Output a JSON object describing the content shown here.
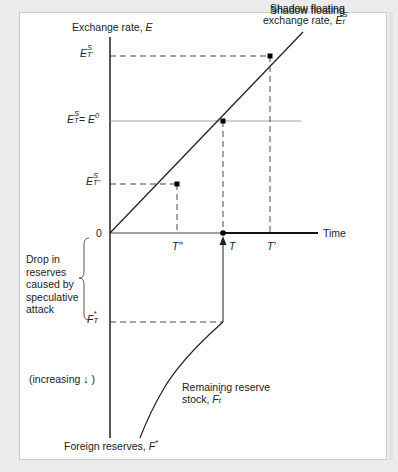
{
  "figure": {
    "y_axis_label": "Exchange rate, ",
    "y_axis_var": "E",
    "x_axis_label": "Time",
    "bottom_axis_label": "Foreign reserves, ",
    "bottom_axis_var": "F",
    "bottom_axis_sup": "*",
    "shadow_label_line1": "Shadow floating",
    "shadow_label_line2": "exchange rate, ",
    "shadow_var": "E",
    "shadow_sup": "S",
    "shadow_sub": "t",
    "tick_E_Tprime": {
      "var": "E",
      "sup": "S",
      "sub": "T'"
    },
    "tick_E_T": {
      "var": "E",
      "sup": "S",
      "sub": "T",
      "eq": "= ",
      "rhs": "E",
      "rhs_sup": "0"
    },
    "tick_E_Tdouble": {
      "var": "E",
      "sup": "S",
      "sub": "T\""
    },
    "origin": "0",
    "time_ticks": [
      "T\"",
      "T",
      "T'"
    ],
    "drop_label": [
      "Drop in",
      "reserves",
      "caused by",
      "speculative",
      "attack"
    ],
    "F_T_label": {
      "var": "F",
      "sup": "*",
      "sub": "T"
    },
    "increasing_label": "(increasing ↓ )",
    "remaining_line1": "Remaining reserve",
    "remaining_line2": "stock, ",
    "remaining_var": "F",
    "remaining_sup": "*",
    "remaining_sub": "t"
  },
  "colors": {
    "axis": "#111111",
    "dashed": "#333333",
    "e0_line": "#999999",
    "background": "#ececec",
    "panel": "#ffffff"
  }
}
